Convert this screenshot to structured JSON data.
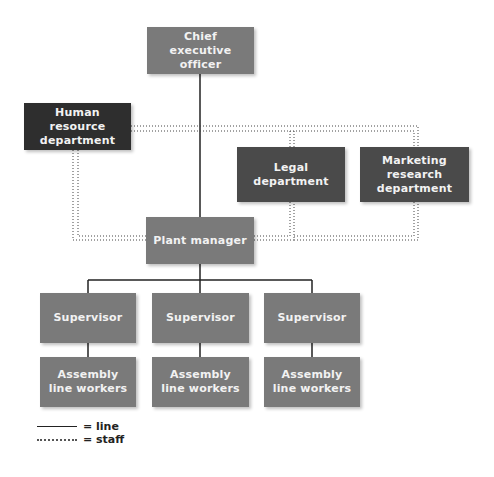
{
  "nodes": {
    "ceo": "Chief executive officer",
    "hr": "Human resource department",
    "legal": "Legal department",
    "marketing": "Marketing research department",
    "plant_manager": "Plant manager",
    "supervisors": [
      "Supervisor",
      "Supervisor",
      "Supervisor"
    ],
    "workers": [
      "Assembly line workers",
      "Assembly line workers",
      "Assembly line workers"
    ]
  },
  "legend": {
    "line_label": "= line",
    "staff_label": "= staff"
  },
  "colors": {
    "line_box": "#7a7a7a",
    "staff_box": "#2e2e2e",
    "staff_box_alt": "#4a4a4a"
  }
}
